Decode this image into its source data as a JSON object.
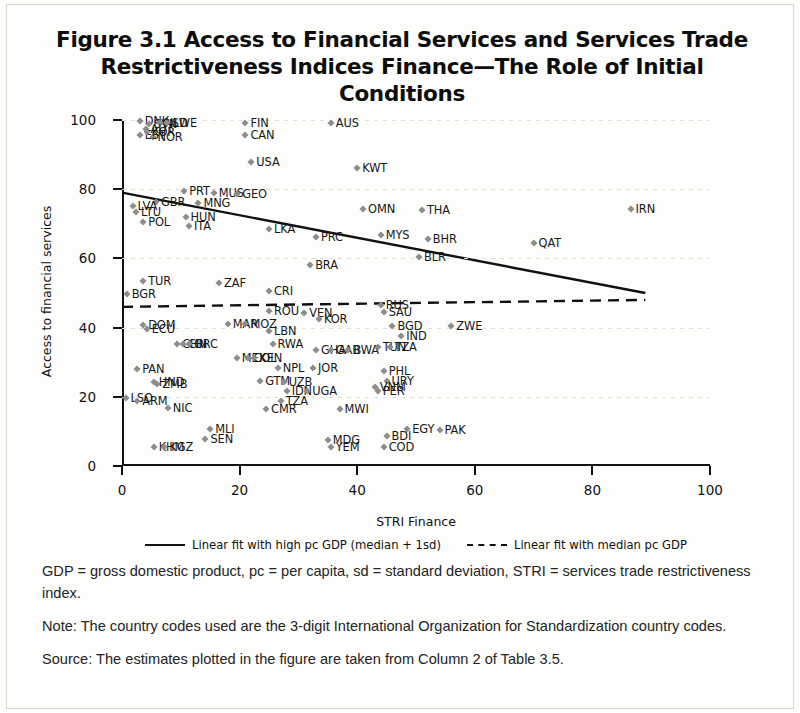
{
  "figure": {
    "title": "Figure 3.1  Access to Financial Services and Services Trade Restrictiveness Indices Finance—The Role of Initial Conditions"
  },
  "notes": {
    "abbreviations": "GDP = gross domestic product, pc = per capita, sd = standard deviation, STRI = services trade restrictiveness index.",
    "note": "Note: The country codes used are the 3-digit International Organization for Standardization country codes.",
    "source": "Source: The estimates plotted in the figure are taken from Column 2 of Table 3.5."
  },
  "chart_data": {
    "type": "scatter",
    "title": "Figure 3.1  Access to Financial Services and Services Trade Restrictiveness Indices Finance—The Role of Initial Conditions",
    "xlabel": "STRI Finance",
    "ylabel": "Access to financial services",
    "xlim": [
      0,
      100
    ],
    "ylim": [
      0,
      100
    ],
    "xticks": [
      0,
      20,
      40,
      60,
      80,
      100
    ],
    "yticks": [
      0,
      20,
      40,
      60,
      80,
      100
    ],
    "grid": "horizontal-dotted",
    "legend_position": "below-axis",
    "points": [
      {
        "label": "DNK",
        "x": 3.0,
        "y": 99.6
      },
      {
        "label": "SVN",
        "x": 4.6,
        "y": 98.8
      },
      {
        "label": "NLD",
        "x": 6.4,
        "y": 99.2
      },
      {
        "label": "AUT",
        "x": 4.0,
        "y": 97.4
      },
      {
        "label": "SWE",
        "x": 7.6,
        "y": 99.0
      },
      {
        "label": "NOR",
        "x": 5.2,
        "y": 95.2
      },
      {
        "label": "EST",
        "x": 3.0,
        "y": 95.6
      },
      {
        "label": "KOR",
        "x": 4.2,
        "y": 96.4
      },
      {
        "label": "FIN",
        "x": 21.0,
        "y": 99.0
      },
      {
        "label": "CAN",
        "x": 21.0,
        "y": 95.6
      },
      {
        "label": "AUS",
        "x": 35.5,
        "y": 99.0
      },
      {
        "label": "USA",
        "x": 22.0,
        "y": 88.0
      },
      {
        "label": "KWT",
        "x": 40.0,
        "y": 86.0
      },
      {
        "label": "PRT",
        "x": 10.6,
        "y": 79.4
      },
      {
        "label": "MUS",
        "x": 15.6,
        "y": 78.8
      },
      {
        "label": "GEO",
        "x": 19.6,
        "y": 78.6
      },
      {
        "label": "GBR",
        "x": 5.8,
        "y": 76.4
      },
      {
        "label": "MNG",
        "x": 13.0,
        "y": 76.0
      },
      {
        "label": "LTU",
        "x": 2.4,
        "y": 73.4
      },
      {
        "label": "LVA",
        "x": 1.8,
        "y": 75.2
      },
      {
        "label": "POL",
        "x": 3.6,
        "y": 70.6
      },
      {
        "label": "HUN",
        "x": 10.8,
        "y": 72.0
      },
      {
        "label": "ITA",
        "x": 11.4,
        "y": 69.4
      },
      {
        "label": "IRN",
        "x": 86.5,
        "y": 74.2
      },
      {
        "label": "OMN",
        "x": 41.0,
        "y": 74.4
      },
      {
        "label": "THA",
        "x": 51.0,
        "y": 74.0
      },
      {
        "label": "LKA",
        "x": 25.0,
        "y": 68.6
      },
      {
        "label": "PRC",
        "x": 33.0,
        "y": 66.2
      },
      {
        "label": "MYS",
        "x": 44.0,
        "y": 66.8
      },
      {
        "label": "BHR",
        "x": 52.0,
        "y": 65.6
      },
      {
        "label": "QAT",
        "x": 70.0,
        "y": 64.4
      },
      {
        "label": "BLR",
        "x": 50.5,
        "y": 60.4
      },
      {
        "label": "BRA",
        "x": 32.0,
        "y": 58.2
      },
      {
        "label": "TUR",
        "x": 3.6,
        "y": 53.4
      },
      {
        "label": "ZAF",
        "x": 16.5,
        "y": 53.0
      },
      {
        "label": "BGR",
        "x": 0.8,
        "y": 49.8
      },
      {
        "label": "CRI",
        "x": 25.0,
        "y": 50.6
      },
      {
        "label": "RUS",
        "x": 44.0,
        "y": 46.6
      },
      {
        "label": "SAU",
        "x": 44.5,
        "y": 44.6
      },
      {
        "label": "ROU",
        "x": 25.0,
        "y": 44.8
      },
      {
        "label": "VEN",
        "x": 31.0,
        "y": 44.2
      },
      {
        "label": "KOR2",
        "x": 33.5,
        "y": 42.6
      },
      {
        "label": "DOM",
        "x": 3.6,
        "y": 40.8
      },
      {
        "label": "ECU",
        "x": 4.2,
        "y": 39.6
      },
      {
        "label": "MAR",
        "x": 18.0,
        "y": 41.0
      },
      {
        "label": "MOZ",
        "x": 21.0,
        "y": 41.0
      },
      {
        "label": "LBN",
        "x": 25.0,
        "y": 39.0
      },
      {
        "label": "BGD",
        "x": 46.0,
        "y": 40.4
      },
      {
        "label": "ZWE",
        "x": 56.0,
        "y": 40.4
      },
      {
        "label": "IND",
        "x": 47.5,
        "y": 37.6
      },
      {
        "label": "CHN",
        "x": 9.4,
        "y": 35.2
      },
      {
        "label": "CRI2",
        "x": 10.4,
        "y": 35.2
      },
      {
        "label": "GRC",
        "x": 11.4,
        "y": 35.2
      },
      {
        "label": "RWA",
        "x": 25.6,
        "y": 35.4
      },
      {
        "label": "GHA",
        "x": 33.0,
        "y": 33.4
      },
      {
        "label": "GAB",
        "x": 35.5,
        "y": 33.4
      },
      {
        "label": "BWA",
        "x": 38.5,
        "y": 33.4
      },
      {
        "label": "TUN",
        "x": 43.5,
        "y": 34.4
      },
      {
        "label": "TZA",
        "x": 45.5,
        "y": 34.4
      },
      {
        "label": "MEX",
        "x": 19.5,
        "y": 31.2
      },
      {
        "label": "COL",
        "x": 21.5,
        "y": 31.2
      },
      {
        "label": "KEN",
        "x": 22.5,
        "y": 31.2
      },
      {
        "label": "PAN",
        "x": 2.6,
        "y": 28.0
      },
      {
        "label": "NPL",
        "x": 26.5,
        "y": 28.4
      },
      {
        "label": "JOR",
        "x": 32.5,
        "y": 28.4
      },
      {
        "label": "PHL",
        "x": 44.5,
        "y": 27.6
      },
      {
        "label": "URY",
        "x": 45.0,
        "y": 24.6
      },
      {
        "label": "GTM",
        "x": 23.5,
        "y": 24.6
      },
      {
        "label": "UZB",
        "x": 27.5,
        "y": 24.4
      },
      {
        "label": "ZMB",
        "x": 6.0,
        "y": 23.6
      },
      {
        "label": "HND",
        "x": 5.4,
        "y": 24.4
      },
      {
        "label": "IDN",
        "x": 28.0,
        "y": 21.8
      },
      {
        "label": "UGA",
        "x": 31.5,
        "y": 21.8
      },
      {
        "label": "VNM",
        "x": 43.0,
        "y": 22.8
      },
      {
        "label": "PER",
        "x": 43.5,
        "y": 21.6
      },
      {
        "label": "LSO",
        "x": 0.6,
        "y": 19.6
      },
      {
        "label": "ARM",
        "x": 2.6,
        "y": 18.8
      },
      {
        "label": "TZA2",
        "x": 27.0,
        "y": 18.8
      },
      {
        "label": "NIC",
        "x": 7.8,
        "y": 16.8
      },
      {
        "label": "CMR",
        "x": 24.5,
        "y": 16.4
      },
      {
        "label": "MWI",
        "x": 37.0,
        "y": 16.6
      },
      {
        "label": "MLI",
        "x": 15.0,
        "y": 10.8
      },
      {
        "label": "EGY",
        "x": 48.5,
        "y": 10.6
      },
      {
        "label": "PAK",
        "x": 54.0,
        "y": 10.4
      },
      {
        "label": "BDI",
        "x": 45.0,
        "y": 8.8
      },
      {
        "label": "SEN",
        "x": 14.2,
        "y": 7.8
      },
      {
        "label": "MDG",
        "x": 35.0,
        "y": 7.6
      },
      {
        "label": "YEM",
        "x": 35.5,
        "y": 5.4
      },
      {
        "label": "COD",
        "x": 44.5,
        "y": 5.6
      },
      {
        "label": "KHM",
        "x": 5.4,
        "y": 5.4
      },
      {
        "label": "KGZ",
        "x": 7.2,
        "y": 5.4
      }
    ],
    "fit_lines": [
      {
        "name": "Linear fit with high pc GDP (median + 1sd)",
        "style": "solid",
        "x0": 0.0,
        "y0": 79.0,
        "x1": 89.0,
        "y1": 50.0
      },
      {
        "name": "Linear fit with median pc GDP",
        "style": "dashed",
        "x0": 0.0,
        "y0": 46.0,
        "x1": 89.0,
        "y1": 48.0
      }
    ]
  },
  "legend": {
    "items": [
      {
        "label": "Linear fit with high pc GDP (median + 1sd)",
        "style": "solid"
      },
      {
        "label": "Linear fit with median pc GDP",
        "style": "dashed"
      }
    ]
  }
}
